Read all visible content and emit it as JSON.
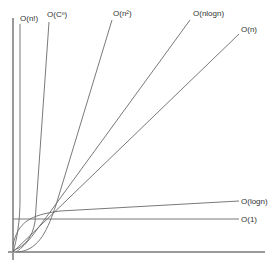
{
  "chart_data": {
    "type": "line",
    "title": "",
    "xlabel": "",
    "ylabel": "",
    "grid": false,
    "legend": "inline-labels",
    "series": [
      {
        "name": "O(n!)",
        "label": "O(n!)",
        "kind": "factorial"
      },
      {
        "name": "O(C^n)",
        "label": "O(Cⁿ)",
        "kind": "exponential"
      },
      {
        "name": "O(n^2)",
        "label": "O(n²)",
        "kind": "quadratic"
      },
      {
        "name": "O(nlogn)",
        "label": "O(nlogn)",
        "kind": "linearithmic"
      },
      {
        "name": "O(n)",
        "label": "O(n)",
        "kind": "linear"
      },
      {
        "name": "O(logn)",
        "label": "O(logn)",
        "kind": "logarithmic"
      },
      {
        "name": "O(1)",
        "label": "O(1)",
        "kind": "constant"
      }
    ]
  }
}
